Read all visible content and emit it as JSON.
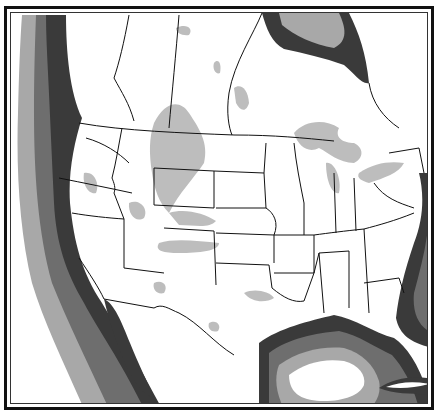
{
  "map": {
    "title": "North America shaded zone map",
    "region": "Contiguous United States and southern Canada",
    "legend_visible": false,
    "colors": {
      "land": "#ffffff",
      "borders": "#111111",
      "coast_band_1": "#3a3a3a",
      "coast_band_2": "#6e6e6e",
      "coast_band_3": "#a8a8a8",
      "inland_zones": "#bdbdbd",
      "ocean_far": "#ffffff"
    },
    "features": [
      "Pacific coastal shading bands",
      "Gulf of Mexico shading bands",
      "Hudson Bay shading bands",
      "Atlantic coastal shading bands",
      "Great Lakes",
      "Inland gray zones over Rockies and Plains",
      "US state and Canadian province boundaries"
    ]
  }
}
